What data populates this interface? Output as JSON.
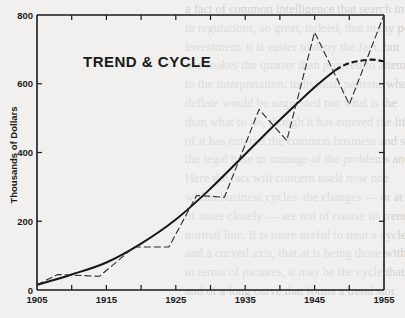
{
  "chart_data": {
    "type": "line",
    "title": "TREND & CYCLE",
    "xlabel": "",
    "ylabel": "Thousands of Dollars",
    "xlim": [
      1905,
      1955
    ],
    "ylim": [
      0,
      800
    ],
    "x_ticks": [
      1905,
      1915,
      1925,
      1935,
      1945,
      1955
    ],
    "y_ticks": [
      0,
      200,
      400,
      600,
      800
    ],
    "grid": false,
    "legend": null,
    "series": [
      {
        "name": "Cycle (actual)",
        "style": "dashed",
        "x": [
          1905,
          1908,
          1914,
          1919,
          1924,
          1928,
          1932,
          1937,
          1941,
          1945,
          1950,
          1955
        ],
        "values": [
          15,
          45,
          40,
          125,
          125,
          275,
          270,
          525,
          435,
          750,
          540,
          800
        ]
      },
      {
        "name": "Trend",
        "style": "solid, dashed extrapolation after ~1948",
        "x": [
          1905,
          1910,
          1915,
          1920,
          1925,
          1930,
          1935,
          1940,
          1945,
          1948,
          1950,
          1953,
          1955
        ],
        "values": [
          15,
          45,
          80,
          135,
          205,
          295,
          395,
          495,
          590,
          640,
          660,
          670,
          665
        ]
      }
    ]
  },
  "labels": {
    "title": "TREND & CYCLE",
    "ylabel": "Thousands of Dollars",
    "x_ticks": [
      "1905",
      "1915",
      "1925",
      "1935",
      "1945",
      "1955"
    ],
    "y_ticks": [
      "0",
      "200",
      "400",
      "600",
      "800"
    ]
  },
  "background_text": [
    "a fact of common intelligence that search in ut",
    "in regulations, so great, indeed, that many pe",
    "investment. it is easier to deny the fact. but",
    "one makes the quarter than proceed to attempt",
    "to the interpretation. individual patterns where",
    "deflate would be suggested not what is the",
    "than what to do, though it has entered the life",
    "of it has entered the common business and soc",
    "the legal base in manage of the problems and ",
    "  Here the fact will concern itself now one",
    "within business cycles. the changes — or at th",
    "of more closely — are not of course its trends",
    "normal line. It is more useful to treat a cycle",
    "and a curved axis, that at is being those with",
    "in terms of pictures, it may be the cycle that",
    "and of a long curve that forms a trend stor"
  ]
}
